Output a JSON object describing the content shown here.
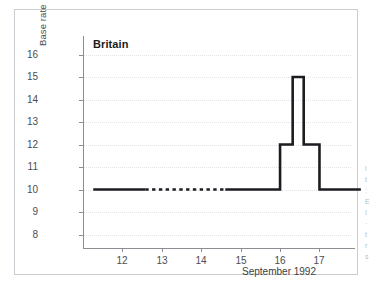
{
  "chart_data": {
    "type": "line",
    "title": "Britain",
    "xlabel": "September 1992",
    "ylabel": "Base rate",
    "xlim": [
      11.0,
      17.8
    ],
    "ylim": [
      7.4,
      16.6
    ],
    "xticks": [
      12,
      13,
      14,
      15,
      16,
      17
    ],
    "xtick_labels": [
      "12",
      "13",
      "14",
      "15",
      "16",
      "17"
    ],
    "yticks": [
      8,
      9,
      10,
      11,
      12,
      13,
      14,
      15,
      16
    ],
    "ytick_labels": [
      "8",
      "9",
      "10",
      "11",
      "12",
      "13",
      "14",
      "15",
      "16"
    ],
    "grid": true,
    "grid_axis": "y",
    "legend": false,
    "line_color": "#1b1d20",
    "line_width": 2.6,
    "series": [
      {
        "name": "Base rate",
        "style": "step-post",
        "segments": [
          {
            "style": "solid",
            "points": [
              {
                "x": 11.26,
                "y": 10
              },
              {
                "x": 12.58,
                "y": 10
              }
            ]
          },
          {
            "style": "dashed",
            "points": [
              {
                "x": 12.58,
                "y": 10
              },
              {
                "x": 14.61,
                "y": 10
              }
            ]
          },
          {
            "style": "solid",
            "points": [
              {
                "x": 14.61,
                "y": 10
              },
              {
                "x": 16.0,
                "y": 10
              },
              {
                "x": 16.0,
                "y": 12
              },
              {
                "x": 16.32,
                "y": 12
              },
              {
                "x": 16.32,
                "y": 15
              },
              {
                "x": 16.6,
                "y": 15
              },
              {
                "x": 16.6,
                "y": 12
              },
              {
                "x": 17.0,
                "y": 12
              },
              {
                "x": 17.0,
                "y": 10
              },
              {
                "x": 18.05,
                "y": 10
              }
            ]
          }
        ]
      }
    ],
    "annotations": [
      {
        "text": "Britain",
        "role": "panel-title"
      },
      {
        "text": "September 1992",
        "role": "x-axis-caption"
      }
    ]
  },
  "colors": {
    "panel_border": "#c9ccd1",
    "axis": "#8a8d91",
    "grid": "#e3e5e8",
    "line": "#1b1d20",
    "tick_text": "#4a4d52",
    "background": "#ffffff"
  }
}
